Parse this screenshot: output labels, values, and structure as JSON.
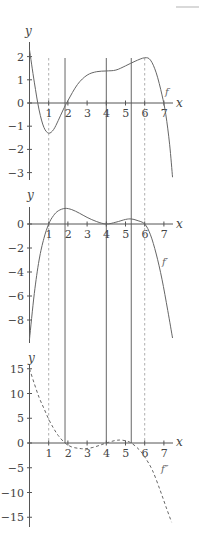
{
  "figure": {
    "colors": {
      "axis": "#555555",
      "curve": "#666666",
      "solid_line": "#555555",
      "dashed_line": "#9a9a9a",
      "corner_mark": "#d9d9d9"
    },
    "x_ticks": [
      1,
      2,
      3,
      4,
      5,
      6,
      7
    ],
    "vertical_lines": [
      {
        "x": 1,
        "style": "dashed"
      },
      {
        "x": 1.85,
        "style": "solid"
      },
      {
        "x": 4,
        "style": "solid"
      },
      {
        "x": 5.3,
        "style": "solid"
      },
      {
        "x": 6,
        "style": "dashed"
      }
    ]
  },
  "chart_data": [
    {
      "type": "line",
      "name": "f",
      "curve_label": "f",
      "xlabel": "x",
      "ylabel": "y",
      "y_ticks": [
        2,
        1,
        0,
        -1,
        -2,
        -3
      ],
      "y_tick_labels": [
        "2",
        "1",
        "0",
        "−1",
        "−2",
        "−3"
      ],
      "xlim": [
        0,
        7.5
      ],
      "ylim": [
        -3.3,
        2.7
      ],
      "line_style": "solid",
      "x": [
        0,
        0.25,
        0.5,
        0.75,
        1,
        1.25,
        1.5,
        1.75,
        2,
        2.5,
        3,
        3.5,
        4,
        4.5,
        5,
        5.5,
        6,
        6.3,
        6.6,
        6.9,
        7.1,
        7.3,
        7.45
      ],
      "y": [
        2.3,
        0.9,
        -0.3,
        -1.05,
        -1.3,
        -1.15,
        -0.75,
        -0.3,
        0.1,
        0.8,
        1.2,
        1.35,
        1.38,
        1.42,
        1.6,
        1.8,
        1.95,
        1.85,
        1.3,
        0.35,
        -0.5,
        -1.8,
        -3.2
      ]
    },
    {
      "type": "line",
      "name": "f'",
      "curve_label": "f′",
      "xlabel": "x",
      "ylabel": "y",
      "y_ticks": [
        0,
        -2,
        -4,
        -6,
        -8
      ],
      "y_tick_labels": [
        "0",
        "−2",
        "−4",
        "−6",
        "−8"
      ],
      "xlim": [
        0,
        7.5
      ],
      "ylim": [
        -9.8,
        1.5
      ],
      "line_style": "solid",
      "x": [
        0,
        0.25,
        0.5,
        0.75,
        1,
        1.25,
        1.5,
        1.85,
        2.2,
        2.6,
        3,
        3.5,
        4,
        4.5,
        5,
        5.3,
        5.6,
        6,
        6.3,
        6.6,
        6.9,
        7.2,
        7.45
      ],
      "y": [
        -9.6,
        -5.8,
        -3.0,
        -1.2,
        0,
        0.7,
        1.1,
        1.3,
        1.2,
        0.9,
        0.55,
        0.2,
        0,
        0.15,
        0.38,
        0.42,
        0.3,
        0,
        -0.9,
        -2.5,
        -4.6,
        -7.2,
        -9.5
      ]
    },
    {
      "type": "line",
      "name": "f''",
      "curve_label": "f″",
      "xlabel": "x",
      "ylabel": "y",
      "y_ticks": [
        15,
        10,
        5,
        0,
        -5,
        -10,
        -15
      ],
      "y_tick_labels": [
        "15",
        "10",
        "5",
        "0",
        "−5",
        "−10",
        "−15"
      ],
      "xlim": [
        0,
        7.5
      ],
      "ylim": [
        -17,
        16
      ],
      "line_style": "dashed",
      "x": [
        0,
        0.25,
        0.5,
        0.75,
        1,
        1.25,
        1.5,
        1.85,
        2.2,
        2.6,
        2.9,
        3.3,
        3.7,
        4,
        4.4,
        4.7,
        5,
        5.3,
        5.7,
        6,
        6.4,
        6.8,
        7.1,
        7.4
      ],
      "y": [
        15,
        12,
        9.2,
        7,
        4.8,
        3.0,
        1.5,
        0,
        -0.8,
        -1.1,
        -1.15,
        -0.9,
        -0.4,
        0,
        0.45,
        0.6,
        0.45,
        0,
        -1.3,
        -2.8,
        -5.5,
        -9.5,
        -12.8,
        -16
      ]
    }
  ],
  "panels": [
    {
      "ylabel": "y",
      "xlabel": "x",
      "curve_label": "f"
    },
    {
      "ylabel": "y",
      "xlabel": "x",
      "curve_label": "f′"
    },
    {
      "ylabel": "y",
      "xlabel": "x",
      "curve_label": "f″"
    }
  ]
}
